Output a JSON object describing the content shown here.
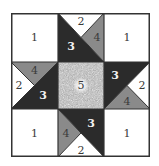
{
  "diagram": {
    "colors": {
      "piece_1": "#ffffff",
      "piece_2": "#ffffff",
      "piece_3": "#2b2b2b",
      "piece_4": "#8a8a8a",
      "piece_5": "#b8b8b8",
      "outline": "#333333"
    },
    "corners": {
      "top_left": "1",
      "top_right": "1",
      "bottom_left": "1",
      "bottom_right": "1"
    },
    "center": "5",
    "top_middle": {
      "white": "2",
      "dark": "3",
      "gray": "4"
    },
    "middle_left": {
      "white": "2",
      "dark": "3",
      "gray": "4"
    },
    "middle_right": {
      "white": "2",
      "dark": "3",
      "gray": "4"
    },
    "bottom_middle": {
      "white": "2",
      "dark": "3",
      "gray": "4"
    }
  }
}
